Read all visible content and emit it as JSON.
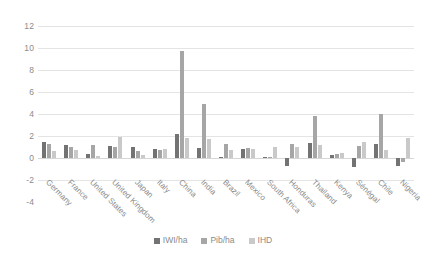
{
  "chart_data": {
    "type": "bar",
    "title": "",
    "subtitle": "",
    "xlabel": "",
    "ylabel": "",
    "ylim": [
      -4,
      12
    ],
    "yticks": [
      12,
      10,
      8,
      6,
      4,
      2,
      0,
      -2,
      -4
    ],
    "grid": true,
    "legend_position": "bottom",
    "categories": [
      "Germany",
      "France",
      "United States",
      "United Kingdom",
      "Japan",
      "Italy",
      "China",
      "India",
      "Brazil",
      "Mexico",
      "South Africa",
      "Honduras",
      "Thailand",
      "Kenya",
      "Sénégal",
      "Chile",
      "Nigeria"
    ],
    "series": [
      {
        "name": "IWI/ha",
        "color": "#737373",
        "values": [
          1.5,
          1.2,
          0.4,
          1.1,
          1.0,
          0.8,
          2.2,
          0.9,
          0.1,
          0.8,
          0.05,
          -0.7,
          1.4,
          0.3,
          -0.8,
          1.3,
          -0.7
        ]
      },
      {
        "name": "Pib/ha",
        "color": "#a6a6a6",
        "values": [
          1.3,
          1.0,
          1.2,
          1.0,
          0.6,
          0.7,
          9.7,
          4.9,
          1.3,
          0.9,
          0.1,
          1.3,
          3.8,
          0.4,
          1.1,
          4.0,
          -0.4
        ]
      },
      {
        "name": "IHD",
        "color": "#c9c9c9",
        "values": [
          0.6,
          0.7,
          0.2,
          1.9,
          0.3,
          0.8,
          1.8,
          1.7,
          0.7,
          0.8,
          1.0,
          1.0,
          1.2,
          0.5,
          1.5,
          0.7,
          1.8
        ]
      }
    ]
  },
  "legend": {
    "items": [
      {
        "label": "IWI/ha",
        "color": "#737373"
      },
      {
        "label": "Pib/ha",
        "color": "#a6a6a6"
      },
      {
        "label": "IHD",
        "color": "#c9c9c9"
      }
    ]
  }
}
